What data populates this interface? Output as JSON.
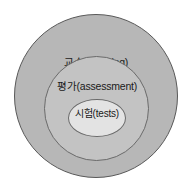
{
  "diagram": {
    "type": "nested-concentric-circles",
    "background_color": "#ffffff",
    "levels": [
      {
        "id": "outer",
        "label": "교수(teaching)",
        "korean": "교수",
        "english": "teaching",
        "fill_color": "#b7b7b7",
        "stroke_color": "#595959"
      },
      {
        "id": "middle",
        "label": "평가(assessment)",
        "korean": "평가",
        "english": "assessment",
        "fill_color": "#c3c3c3",
        "stroke_color": "#6a6a6a"
      },
      {
        "id": "inner",
        "label": "시험(tests)",
        "korean": "시험",
        "english": "tests",
        "fill_color": "#e3e3e3",
        "stroke_color": "#6a6a6a"
      }
    ]
  }
}
